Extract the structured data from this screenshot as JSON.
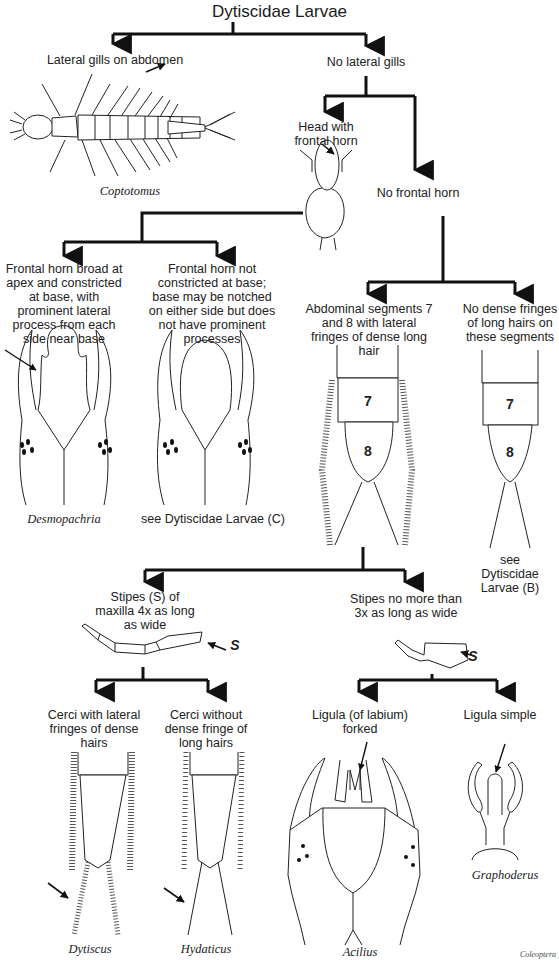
{
  "title": "Dytiscidae Larvae",
  "nodes": {
    "lateral_gills": "Lateral gills on abdomen",
    "no_lateral_gills": "No lateral gills",
    "head_frontal_horn": "Head with frontal horn",
    "no_frontal_horn": "No frontal horn",
    "horn_broad": "Frontal horn broad at apex and constricted at base, with prominent lateral process from each side near base",
    "horn_not_constricted": "Frontal horn not constricted at base; base may be notched on either side but does not have prominent processes",
    "segments_fringed": "Abdominal segments 7 and 8 with lateral fringes of dense long hair",
    "segments_no_fringe": "No dense fringes of long hairs on these segments",
    "stipes_4x": "Stipes (S) of maxilla 4x as long as wide",
    "stipes_3x": "Stipes no more than 3x as long as wide",
    "cerci_fringed": "Cerci with lateral fringes of dense hairs",
    "cerci_no_fringe": "Cerci without dense fringe of long hairs",
    "ligula_forked": "Ligula (of labium) forked",
    "ligula_simple": "Ligula simple"
  },
  "taxa": {
    "coptotomus": "Coptotomus",
    "desmopachria": "Desmopachria",
    "see_c": "see Dytiscidae Larvae (C)",
    "see_b": "see Dytiscidae Larvae (B)",
    "dytiscus": "Dytiscus",
    "hydaticus": "Hydaticus",
    "acilius": "Acilius",
    "graphoderus": "Graphoderus"
  },
  "figure_labels": {
    "seg7": "7",
    "seg8": "8",
    "stipes_s": "S"
  },
  "credit": "Coleoptera"
}
